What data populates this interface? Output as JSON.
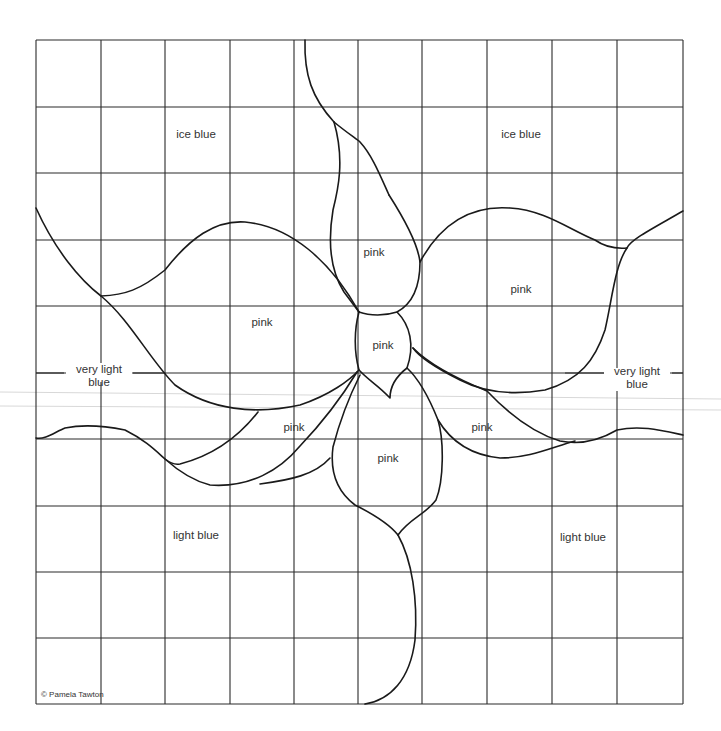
{
  "pattern": {
    "grid": {
      "x": [
        36,
        101,
        165,
        230,
        294,
        358,
        422,
        487,
        552,
        617,
        683
      ],
      "y": [
        40,
        107,
        173,
        240,
        306,
        373,
        439,
        506,
        572,
        638,
        704
      ],
      "line_color": "#2a2a2a"
    },
    "outline_color": "#1a1a1a",
    "labels": [
      {
        "id": "ice-blue-left",
        "text": "ice blue",
        "x": 196,
        "y": 135
      },
      {
        "id": "ice-blue-right",
        "text": "ice  blue",
        "x": 521,
        "y": 135
      },
      {
        "id": "pink-top",
        "text": "pink",
        "x": 374,
        "y": 253
      },
      {
        "id": "pink-upper-right",
        "text": "pink",
        "x": 521,
        "y": 290
      },
      {
        "id": "pink-upper-left",
        "text": "pink",
        "x": 262,
        "y": 323
      },
      {
        "id": "pink-center",
        "text": "pink",
        "x": 383,
        "y": 346
      },
      {
        "id": "pink-lower-left",
        "text": "pink",
        "x": 294,
        "y": 428
      },
      {
        "id": "pink-lower-right",
        "text": "pink",
        "x": 482,
        "y": 428
      },
      {
        "id": "pink-bottom",
        "text": "pink",
        "x": 388,
        "y": 459
      },
      {
        "id": "light-blue-left",
        "text": "light blue",
        "x": 196,
        "y": 536
      },
      {
        "id": "light-blue-right",
        "text": "light  blue",
        "x": 583,
        "y": 538
      }
    ],
    "very_light_blue_left": {
      "line1": "very light",
      "line2": "blue"
    },
    "very_light_blue_right": {
      "line1": "very light",
      "line2": "blue"
    },
    "copyright": "© Pamela Tawton"
  }
}
